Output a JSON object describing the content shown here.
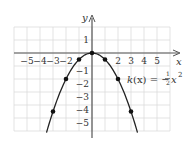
{
  "chart_data": {
    "type": "line",
    "title": "",
    "xlabel": "x",
    "ylabel": "y",
    "xlim": [
      -6,
      6
    ],
    "ylim": [
      -6,
      2
    ],
    "grid": true,
    "x_ticks": [
      "-5",
      "-4",
      "-3",
      "-2",
      "2",
      "3",
      "4",
      "5"
    ],
    "y_ticks": [
      "1",
      "-1",
      "-2",
      "-3",
      "-4",
      "-5"
    ],
    "series": [
      {
        "name": "k(x) = -1/2 x^2",
        "function": "-0.5*x^2",
        "points": [
          {
            "x": -3,
            "y": -4.5
          },
          {
            "x": -2,
            "y": -2
          },
          {
            "x": -1,
            "y": -0.5
          },
          {
            "x": 0,
            "y": 0
          },
          {
            "x": 1,
            "y": -0.5
          },
          {
            "x": 2,
            "y": -2
          },
          {
            "x": 3,
            "y": -4.5
          }
        ]
      }
    ],
    "annotations": [
      {
        "text_prefix": "k(x) = −",
        "frac_num": "1",
        "frac_den": "2",
        "text_suffix": "x",
        "exponent": "2"
      }
    ]
  }
}
